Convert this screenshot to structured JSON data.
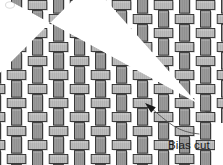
{
  "figure": {
    "title": "Bias cut",
    "type": "woven-fabric-diagram",
    "background_color": "#ffffff",
    "width": 223,
    "height": 165
  },
  "annotation": {
    "label": "Bias cut",
    "label_x": 168,
    "label_y": 140,
    "arrow_tip_x": 145,
    "arrow_tip_y": 103,
    "arrow_tail_x": 199,
    "arrow_tail_y": 134,
    "arrow_color": "#555555",
    "arrowhead_color": "#1a1a1a"
  },
  "cut": {
    "name": "bias-cut",
    "angle_degrees": 45,
    "gap_width": 9,
    "gap_color": "#ffffff",
    "start_x": 88,
    "start_y": -6,
    "end_x": 206,
    "end_y": 112
  },
  "weave": {
    "pattern": "plain-weave",
    "cell_width": 21,
    "cell_height": 14,
    "columns": 10,
    "rows": 12,
    "origin_x": 6,
    "origin_y": 12,
    "warp_color": "#9a9a9a",
    "weft_color": "#bdbdbd",
    "warp_shadow_color": "#8a8a8a",
    "weft_shadow_color": "#ababab",
    "stroke_color": "#2c2c2c",
    "stroke_width": 0.9,
    "stripe_color": "#a8a8a8",
    "thread_inset": 1.2
  },
  "fabric_body": {
    "left": 6,
    "top": 12,
    "right": 200,
    "bottom": 158
  },
  "corner_mark": {
    "x": 9,
    "y": 4,
    "color": "#d8d8d8"
  }
}
